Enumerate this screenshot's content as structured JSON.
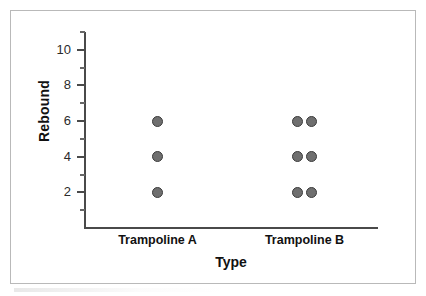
{
  "chart_data": {
    "type": "scatter",
    "title": "",
    "xlabel": "Type",
    "ylabel": "Rebound",
    "categories": [
      "Trampoline A",
      "Trampoline B"
    ],
    "ylim": [
      0,
      11
    ],
    "y_ticks_major": [
      2,
      4,
      6,
      8,
      10
    ],
    "y_ticks_minor": [
      1,
      3,
      5,
      7,
      9,
      11
    ],
    "grid": false,
    "legend": "none",
    "series": [
      {
        "name": "Trampoline A",
        "points": [
          {
            "x": "Trampoline A",
            "y": 6
          },
          {
            "x": "Trampoline A",
            "y": 4
          },
          {
            "x": "Trampoline A",
            "y": 2
          }
        ]
      },
      {
        "name": "Trampoline B",
        "points": [
          {
            "x": "Trampoline B",
            "y": 6
          },
          {
            "x": "Trampoline B",
            "y": 6
          },
          {
            "x": "Trampoline B",
            "y": 4
          },
          {
            "x": "Trampoline B",
            "y": 4
          },
          {
            "x": "Trampoline B",
            "y": 2
          },
          {
            "x": "Trampoline B",
            "y": 2
          }
        ]
      }
    ],
    "marker_color": "#6f6f6f",
    "marker_edge_color": "#3b3b3b",
    "axis_color": "#4a4a4a",
    "frame_color": "#b9b9b9"
  },
  "axes": {
    "y_title": "Rebound",
    "x_title": "Type",
    "y_tick_labels": [
      "2",
      "4",
      "6",
      "8",
      "10"
    ],
    "x_tick_labels": [
      "Trampoline A",
      "Trampoline B"
    ]
  }
}
